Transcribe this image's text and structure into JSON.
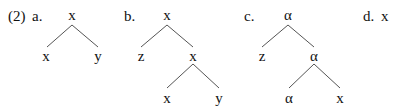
{
  "example_number": "(2)",
  "trees": [
    {
      "label": "a.",
      "root": "x",
      "children": [
        "x",
        "y"
      ]
    },
    {
      "label": "b.",
      "root": "x",
      "children": [
        "z",
        "x"
      ],
      "subtree": {
        "root": "x",
        "children": [
          "x",
          "y"
        ]
      }
    },
    {
      "label": "c.",
      "root": "α",
      "children": [
        "z",
        "α"
      ],
      "subtree": {
        "root": "α",
        "children": [
          "α",
          "x"
        ]
      }
    },
    {
      "label": "d.",
      "root": "x"
    }
  ]
}
